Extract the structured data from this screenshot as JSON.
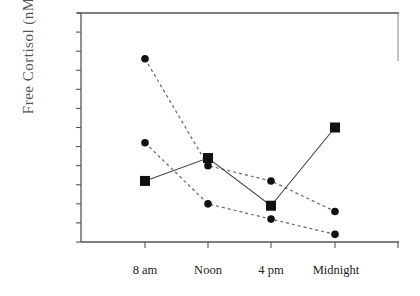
{
  "chart_data": {
    "type": "line",
    "title": "",
    "xlabel": "",
    "ylabel": "Free Cortisol (nM)",
    "categories": [
      "8 am",
      "Noon",
      "4 pm",
      "Midnight"
    ],
    "y_units": "tick units (axis has 12 unlabeled tick intervals; 0 = x-axis)",
    "ylim": [
      0,
      12
    ],
    "y_tick_labels_shown": false,
    "grid": false,
    "legend": null,
    "series": [
      {
        "name": "Series A (dashed, circles, upper)",
        "style": "dashed",
        "marker": "circle",
        "values": [
          9.6,
          4.0,
          3.2,
          1.6
        ]
      },
      {
        "name": "Series B (dashed, circles, lower)",
        "style": "dashed",
        "marker": "circle",
        "values": [
          5.2,
          2.0,
          1.2,
          0.4
        ]
      },
      {
        "name": "Series C (solid, squares)",
        "style": "solid",
        "marker": "square",
        "values": [
          3.2,
          4.4,
          1.9,
          6.0
        ]
      }
    ]
  },
  "axis": {
    "ylabel": "Free Cortisol (nM)",
    "xticks": [
      "8 am",
      "Noon",
      "4 pm",
      "Midnight"
    ]
  },
  "colors": {
    "axis": "#555555",
    "marker": "#111111",
    "dashed_line": "#666666",
    "solid_line": "#444444"
  }
}
